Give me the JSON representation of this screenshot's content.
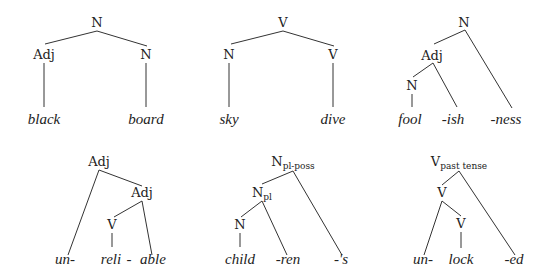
{
  "trees": [
    {
      "id": "black-board",
      "root": "N",
      "nodes": {
        "root": "N",
        "left": "Adj",
        "right": "N"
      },
      "leaves": [
        "black",
        "board"
      ]
    },
    {
      "id": "sky-dive",
      "root": "V",
      "nodes": {
        "root": "V",
        "left": "N",
        "right": "V"
      },
      "leaves": [
        "sky",
        "dive"
      ]
    },
    {
      "id": "foolishness",
      "nodes": {
        "root": "N",
        "mid": "Adj",
        "low": "N"
      },
      "leaves": [
        "fool",
        "-ish",
        "-ness"
      ]
    },
    {
      "id": "unreliable",
      "nodes": {
        "root": "Adj",
        "mid": "Adj",
        "low": "V"
      },
      "leaves": [
        "un-",
        "reli",
        "-",
        "able"
      ]
    },
    {
      "id": "childrens",
      "nodes": {
        "root": "N",
        "root_sub": "pl-poss",
        "mid": "N",
        "mid_sub": "pl",
        "low": "N"
      },
      "leaves": [
        "child",
        "-ren",
        "-'s"
      ]
    },
    {
      "id": "unlocked",
      "nodes": {
        "root": "V",
        "root_sub": "past tense",
        "mid": "V",
        "low": "V"
      },
      "leaves": [
        "un-",
        "lock",
        "-ed"
      ]
    }
  ]
}
